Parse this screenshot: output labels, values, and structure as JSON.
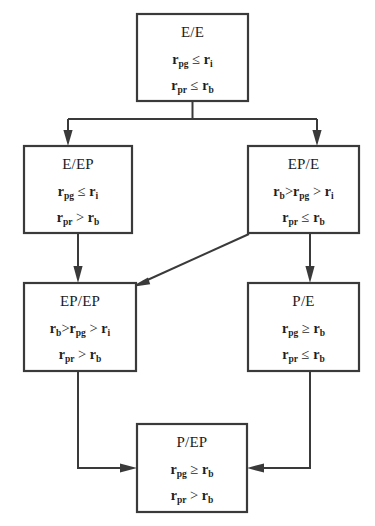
{
  "figure": {
    "type": "state-transition-flowchart",
    "background_color": "#ffffff",
    "line_color": "#3a3a3a",
    "text_color": "#1d1d1d"
  },
  "symbols": {
    "r": "r",
    "sub_pg": "pg",
    "sub_pr": "pr",
    "sub_i": "i",
    "sub_b": "b",
    "leq": "≤",
    "geq": "≥",
    "gt": ">"
  },
  "nodes": [
    {
      "id": "e-e",
      "title": "E/E",
      "conditions": [
        {
          "lhs_base": "r",
          "lhs_sub": "pg",
          "op": "≤",
          "rhs_base": "r",
          "rhs_sub": "i"
        },
        {
          "lhs_base": "r",
          "lhs_sub": "pr",
          "op": "≤",
          "rhs_base": "r",
          "rhs_sub": "b"
        }
      ],
      "condition_text": [
        "r_pg ≤ r_i",
        "r_pr ≤ r_b"
      ]
    },
    {
      "id": "e-ep",
      "title": "E/EP",
      "conditions": [
        {
          "lhs_base": "r",
          "lhs_sub": "pg",
          "op": "≤",
          "rhs_base": "r",
          "rhs_sub": "i"
        },
        {
          "lhs_base": "r",
          "lhs_sub": "pr",
          "op": ">",
          "rhs_base": "r",
          "rhs_sub": "b"
        }
      ],
      "condition_text": [
        "r_pg ≤ r_i",
        "r_pr > r_b"
      ]
    },
    {
      "id": "ep-e",
      "title": "EP/E",
      "conditions": [
        {
          "chain": true,
          "a_base": "r",
          "a_sub": "b",
          "op1": ">",
          "b_base": "r",
          "b_sub": "pg",
          "op2": ">",
          "c_base": "r",
          "c_sub": "i"
        },
        {
          "lhs_base": "r",
          "lhs_sub": "pr",
          "op": "≤",
          "rhs_base": "r",
          "rhs_sub": "b"
        }
      ],
      "condition_text": [
        "r_b > r_pg > r_i",
        "r_pr ≤ r_b"
      ]
    },
    {
      "id": "ep-ep",
      "title": "EP/EP",
      "conditions": [
        {
          "chain": true,
          "a_base": "r",
          "a_sub": "b",
          "op1": ">",
          "b_base": "r",
          "b_sub": "pg",
          "op2": ">",
          "c_base": "r",
          "c_sub": "i"
        },
        {
          "lhs_base": "r",
          "lhs_sub": "pr",
          "op": ">",
          "rhs_base": "r",
          "rhs_sub": "b"
        }
      ],
      "condition_text": [
        "r_b > r_pg > r_i",
        "r_pr > r_b"
      ]
    },
    {
      "id": "p-e",
      "title": "P/E",
      "conditions": [
        {
          "lhs_base": "r",
          "lhs_sub": "pg",
          "op": "≥",
          "rhs_base": "r",
          "rhs_sub": "b"
        },
        {
          "lhs_base": "r",
          "lhs_sub": "pr",
          "op": "≤",
          "rhs_base": "r",
          "rhs_sub": "b"
        }
      ],
      "condition_text": [
        "r_pg ≥ r_b",
        "r_pr ≤ r_b"
      ]
    },
    {
      "id": "p-ep",
      "title": "P/EP",
      "conditions": [
        {
          "lhs_base": "r",
          "lhs_sub": "pg",
          "op": "≥",
          "rhs_base": "r",
          "rhs_sub": "b"
        },
        {
          "lhs_base": "r",
          "lhs_sub": "pr",
          "op": ">",
          "rhs_base": "r",
          "rhs_sub": "b"
        }
      ],
      "condition_text": [
        "r_pg ≥ r_b",
        "r_pr > r_b"
      ]
    }
  ],
  "edges": [
    {
      "id": "edge-ee-eep",
      "from": "e-e",
      "to": "e-ep",
      "style": "orthogonal-split-left"
    },
    {
      "id": "edge-ee-epe",
      "from": "e-e",
      "to": "ep-e",
      "style": "orthogonal-split-right"
    },
    {
      "id": "edge-eep-epep",
      "from": "e-ep",
      "to": "ep-ep",
      "style": "vertical"
    },
    {
      "id": "edge-epe-pe",
      "from": "ep-e",
      "to": "p-e",
      "style": "vertical"
    },
    {
      "id": "edge-epe-epep",
      "from": "ep-e",
      "to": "ep-ep",
      "style": "diagonal"
    },
    {
      "id": "edge-epep-pep",
      "from": "ep-ep",
      "to": "p-ep",
      "style": "orthogonal-down-right"
    },
    {
      "id": "edge-pe-pep",
      "from": "p-e",
      "to": "p-ep",
      "style": "orthogonal-down-left"
    }
  ]
}
